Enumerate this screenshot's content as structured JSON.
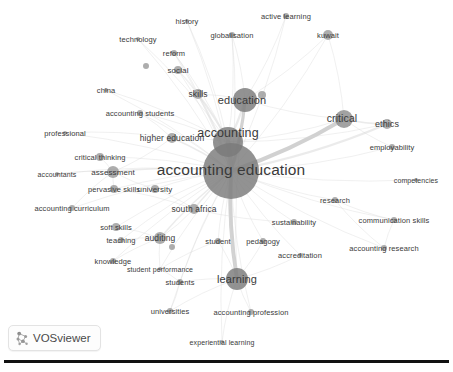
{
  "app": {
    "name": "VOSviewer",
    "badge_label": "VOSviewer",
    "logo_icon": "vosviewer-logo-icon",
    "background_color": "#ffffff"
  },
  "colors": {
    "node_fill": "#8d8d8d",
    "node_fill_dark": "#7a7a7a",
    "edge": "#d8d8d8",
    "edge_strong": "#c9c9c9",
    "label_text": "#3a3a3a",
    "rule": "#111111"
  },
  "chart_data": {
    "type": "scatter",
    "title": "",
    "subtitle": "",
    "xlabel": "",
    "ylabel": "",
    "grid": false,
    "legend_position": "none",
    "nodes": [
      {
        "label": "accounting education",
        "x": 231,
        "y": 171,
        "size": 28,
        "font_size": 15.5,
        "label_dx": 0,
        "label_dy": -1
      },
      {
        "label": "accounting",
        "x": 228,
        "y": 142,
        "size": 15,
        "font_size": 12.5,
        "label_dx": 0,
        "label_dy": -9
      },
      {
        "label": "education",
        "x": 245,
        "y": 100,
        "size": 12,
        "font_size": 11,
        "label_dx": -3,
        "label_dy": 0
      },
      {
        "label": "learning",
        "x": 237,
        "y": 279,
        "size": 11,
        "font_size": 11,
        "label_dx": 0,
        "label_dy": 0
      },
      {
        "label": "critical",
        "x": 344,
        "y": 119,
        "size": 9,
        "font_size": 10.5,
        "label_dx": -2,
        "label_dy": -1
      },
      {
        "label": "ethics",
        "x": 387,
        "y": 124,
        "size": 5,
        "font_size": 9,
        "label_dx": 0,
        "label_dy": 0
      },
      {
        "label": "higher education",
        "x": 172,
        "y": 138,
        "size": 5,
        "font_size": 8.5,
        "label_dx": 0,
        "label_dy": 0
      },
      {
        "label": "assessment",
        "x": 113,
        "y": 172,
        "size": 6,
        "font_size": 8,
        "label_dx": 0,
        "label_dy": 0
      },
      {
        "label": "skills",
        "x": 198,
        "y": 94,
        "size": 5,
        "font_size": 8.5,
        "label_dx": 0,
        "label_dy": 0
      },
      {
        "label": "auditing",
        "x": 160,
        "y": 238,
        "size": 6,
        "font_size": 8.5,
        "label_dx": 0,
        "label_dy": 0
      },
      {
        "label": "south africa",
        "x": 194,
        "y": 209,
        "size": 5,
        "font_size": 8.5,
        "label_dx": 0,
        "label_dy": 0
      },
      {
        "label": "university",
        "x": 155,
        "y": 189,
        "size": 4,
        "font_size": 8,
        "label_dx": 0,
        "label_dy": 0
      },
      {
        "label": "critical thinking",
        "x": 100,
        "y": 157,
        "size": 4,
        "font_size": 7.5,
        "label_dx": 0,
        "label_dy": 0
      },
      {
        "label": "pervasive skills",
        "x": 114,
        "y": 189,
        "size": 4,
        "font_size": 7.5,
        "label_dx": 0,
        "label_dy": 0
      },
      {
        "label": "soft skills",
        "x": 116,
        "y": 227,
        "size": 4,
        "font_size": 7.5,
        "label_dx": 0,
        "label_dy": 0
      },
      {
        "label": "teaching",
        "x": 121,
        "y": 240,
        "size": 3,
        "font_size": 7.5,
        "label_dx": 0,
        "label_dy": 0
      },
      {
        "label": "knowledge",
        "x": 113,
        "y": 261,
        "size": 3,
        "font_size": 7.5,
        "label_dx": 0,
        "label_dy": 0
      },
      {
        "label": "accounting curriculum",
        "x": 72,
        "y": 208,
        "size": 3,
        "font_size": 7.5,
        "label_dx": 0,
        "label_dy": 0
      },
      {
        "label": "accountants",
        "x": 57,
        "y": 174,
        "size": 2,
        "font_size": 7,
        "label_dx": 0,
        "label_dy": 0
      },
      {
        "label": "professional",
        "x": 65,
        "y": 133,
        "size": 2,
        "font_size": 7.5,
        "label_dx": 0,
        "label_dy": 0
      },
      {
        "label": "accounting students",
        "x": 140,
        "y": 113,
        "size": 3,
        "font_size": 7.5,
        "label_dx": 0,
        "label_dy": 0
      },
      {
        "label": "china",
        "x": 106,
        "y": 90,
        "size": 2,
        "font_size": 7.5,
        "label_dx": 0,
        "label_dy": 0
      },
      {
        "label": "technology",
        "x": 138,
        "y": 39,
        "size": 2,
        "font_size": 7.5,
        "label_dx": 0,
        "label_dy": 0
      },
      {
        "label": "reform",
        "x": 174,
        "y": 53,
        "size": 3,
        "font_size": 7.5,
        "label_dx": 0,
        "label_dy": 0
      },
      {
        "label": "social",
        "x": 178,
        "y": 70,
        "size": 4,
        "font_size": 8,
        "label_dx": 0,
        "label_dy": 0
      },
      {
        "label": "history",
        "x": 187,
        "y": 21,
        "size": 2,
        "font_size": 7.5,
        "label_dx": 0,
        "label_dy": 0
      },
      {
        "label": "globalisation",
        "x": 232,
        "y": 35,
        "size": 3,
        "font_size": 7.5,
        "label_dx": 0,
        "label_dy": 0
      },
      {
        "label": "active learning",
        "x": 286,
        "y": 16,
        "size": 3,
        "font_size": 7.5,
        "label_dx": 0,
        "label_dy": 0
      },
      {
        "label": "kuwait",
        "x": 328,
        "y": 35,
        "size": 5,
        "font_size": 7.5,
        "label_dx": 0,
        "label_dy": 0
      },
      {
        "label": "employability",
        "x": 392,
        "y": 147,
        "size": 3,
        "font_size": 7.5,
        "label_dx": 0,
        "label_dy": 0
      },
      {
        "label": "competencies",
        "x": 416,
        "y": 180,
        "size": 2,
        "font_size": 7,
        "label_dx": 0,
        "label_dy": 0
      },
      {
        "label": "research",
        "x": 335,
        "y": 200,
        "size": 3,
        "font_size": 7.5,
        "label_dx": 0,
        "label_dy": 0
      },
      {
        "label": "communication skills",
        "x": 394,
        "y": 220,
        "size": 3,
        "font_size": 7.5,
        "label_dx": 0,
        "label_dy": 0
      },
      {
        "label": "sustainability",
        "x": 294,
        "y": 222,
        "size": 3,
        "font_size": 7.5,
        "label_dx": 0,
        "label_dy": 0
      },
      {
        "label": "accounting research",
        "x": 384,
        "y": 248,
        "size": 3,
        "font_size": 7.5,
        "label_dx": 0,
        "label_dy": 0
      },
      {
        "label": "accreditation",
        "x": 300,
        "y": 255,
        "size": 2,
        "font_size": 7.5,
        "label_dx": 0,
        "label_dy": 0
      },
      {
        "label": "pedagogy",
        "x": 263,
        "y": 241,
        "size": 3,
        "font_size": 7.5,
        "label_dx": 0,
        "label_dy": 0
      },
      {
        "label": "student",
        "x": 218,
        "y": 241,
        "size": 3,
        "font_size": 7.5,
        "label_dx": 0,
        "label_dy": 0
      },
      {
        "label": "student performance",
        "x": 160,
        "y": 269,
        "size": 2,
        "font_size": 7,
        "label_dx": 0,
        "label_dy": 0
      },
      {
        "label": "students",
        "x": 180,
        "y": 282,
        "size": 3,
        "font_size": 7.5,
        "label_dx": 0,
        "label_dy": 0
      },
      {
        "label": "universities",
        "x": 170,
        "y": 311,
        "size": 3,
        "font_size": 7.5,
        "label_dx": 0,
        "label_dy": 0
      },
      {
        "label": "accounting profession",
        "x": 251,
        "y": 312,
        "size": 3,
        "font_size": 7.5,
        "label_dx": 0,
        "label_dy": 0
      },
      {
        "label": "experiential learning",
        "x": 222,
        "y": 342,
        "size": 2,
        "font_size": 7,
        "label_dx": 0,
        "label_dy": 0
      },
      {
        "label": "",
        "x": 146,
        "y": 66,
        "size": 3,
        "font_size": 0,
        "label_dx": 0,
        "label_dy": 0
      },
      {
        "label": "",
        "x": 262,
        "y": 95,
        "size": 4,
        "font_size": 0,
        "label_dx": 0,
        "label_dy": 0
      },
      {
        "label": "",
        "x": 172,
        "y": 247,
        "size": 3,
        "font_size": 0,
        "label_dx": 0,
        "label_dy": 0
      }
    ],
    "edges": [
      {
        "source": "accounting education",
        "target": "accounting",
        "weight": 6
      },
      {
        "source": "accounting education",
        "target": "education",
        "weight": 4
      },
      {
        "source": "accounting education",
        "target": "learning",
        "weight": 5
      },
      {
        "source": "accounting education",
        "target": "critical",
        "weight": 5
      },
      {
        "source": "accounting education",
        "target": "ethics",
        "weight": 3
      },
      {
        "source": "accounting education",
        "target": "higher education",
        "weight": 2
      },
      {
        "source": "accounting education",
        "target": "assessment",
        "weight": 2
      },
      {
        "source": "accounting education",
        "target": "skills",
        "weight": 2
      },
      {
        "source": "accounting education",
        "target": "auditing",
        "weight": 2
      },
      {
        "source": "accounting education",
        "target": "south africa",
        "weight": 2
      },
      {
        "source": "accounting education",
        "target": "university",
        "weight": 1
      },
      {
        "source": "accounting education",
        "target": "critical thinking",
        "weight": 1
      },
      {
        "source": "accounting education",
        "target": "pervasive skills",
        "weight": 1
      },
      {
        "source": "accounting education",
        "target": "soft skills",
        "weight": 1
      },
      {
        "source": "accounting education",
        "target": "teaching",
        "weight": 1
      },
      {
        "source": "accounting education",
        "target": "knowledge",
        "weight": 1
      },
      {
        "source": "accounting education",
        "target": "accounting curriculum",
        "weight": 1
      },
      {
        "source": "accounting education",
        "target": "accountants",
        "weight": 1
      },
      {
        "source": "accounting education",
        "target": "professional",
        "weight": 1
      },
      {
        "source": "accounting education",
        "target": "accounting students",
        "weight": 1
      },
      {
        "source": "accounting education",
        "target": "china",
        "weight": 1
      },
      {
        "source": "accounting education",
        "target": "technology",
        "weight": 1
      },
      {
        "source": "accounting education",
        "target": "reform",
        "weight": 1
      },
      {
        "source": "accounting education",
        "target": "social",
        "weight": 1
      },
      {
        "source": "accounting education",
        "target": "history",
        "weight": 1
      },
      {
        "source": "accounting education",
        "target": "globalisation",
        "weight": 1
      },
      {
        "source": "accounting education",
        "target": "active learning",
        "weight": 1
      },
      {
        "source": "accounting education",
        "target": "kuwait",
        "weight": 1
      },
      {
        "source": "accounting education",
        "target": "employability",
        "weight": 1
      },
      {
        "source": "accounting education",
        "target": "competencies",
        "weight": 1
      },
      {
        "source": "accounting education",
        "target": "research",
        "weight": 1
      },
      {
        "source": "accounting education",
        "target": "communication skills",
        "weight": 1
      },
      {
        "source": "accounting education",
        "target": "sustainability",
        "weight": 1
      },
      {
        "source": "accounting education",
        "target": "accounting research",
        "weight": 1
      },
      {
        "source": "accounting education",
        "target": "accreditation",
        "weight": 1
      },
      {
        "source": "accounting education",
        "target": "pedagogy",
        "weight": 1
      },
      {
        "source": "accounting education",
        "target": "student",
        "weight": 1
      },
      {
        "source": "accounting education",
        "target": "student performance",
        "weight": 1
      },
      {
        "source": "accounting education",
        "target": "students",
        "weight": 1
      },
      {
        "source": "accounting education",
        "target": "universities",
        "weight": 1
      },
      {
        "source": "accounting education",
        "target": "accounting profession",
        "weight": 1
      },
      {
        "source": "accounting education",
        "target": "experiential learning",
        "weight": 1
      },
      {
        "source": "accounting",
        "target": "education",
        "weight": 3
      },
      {
        "source": "accounting",
        "target": "skills",
        "weight": 2
      },
      {
        "source": "accounting",
        "target": "higher education",
        "weight": 1
      },
      {
        "source": "accounting",
        "target": "accounting students",
        "weight": 1
      },
      {
        "source": "accounting",
        "target": "social",
        "weight": 1
      },
      {
        "source": "accounting",
        "target": "reform",
        "weight": 1
      },
      {
        "source": "accounting",
        "target": "history",
        "weight": 1
      },
      {
        "source": "accounting",
        "target": "globalisation",
        "weight": 1
      },
      {
        "source": "accounting",
        "target": "critical",
        "weight": 1
      },
      {
        "source": "accounting",
        "target": "learning",
        "weight": 1
      },
      {
        "source": "accounting",
        "target": "china",
        "weight": 1
      },
      {
        "source": "accounting",
        "target": "technology",
        "weight": 1
      },
      {
        "source": "accounting",
        "target": "ethics",
        "weight": 1
      },
      {
        "source": "education",
        "target": "active learning",
        "weight": 1
      },
      {
        "source": "education",
        "target": "kuwait",
        "weight": 1
      },
      {
        "source": "education",
        "target": "globalisation",
        "weight": 1
      },
      {
        "source": "education",
        "target": "critical",
        "weight": 1
      },
      {
        "source": "education",
        "target": "skills",
        "weight": 1
      },
      {
        "source": "education",
        "target": "learning",
        "weight": 1
      },
      {
        "source": "critical",
        "target": "ethics",
        "weight": 2
      },
      {
        "source": "critical",
        "target": "employability",
        "weight": 1
      },
      {
        "source": "critical",
        "target": "kuwait",
        "weight": 1
      },
      {
        "source": "learning",
        "target": "students",
        "weight": 1
      },
      {
        "source": "learning",
        "target": "universities",
        "weight": 1
      },
      {
        "source": "learning",
        "target": "accounting profession",
        "weight": 1
      },
      {
        "source": "learning",
        "target": "experiential learning",
        "weight": 1
      },
      {
        "source": "learning",
        "target": "pedagogy",
        "weight": 1
      },
      {
        "source": "learning",
        "target": "student",
        "weight": 1
      },
      {
        "source": "learning",
        "target": "accreditation",
        "weight": 1
      },
      {
        "source": "assessment",
        "target": "higher education",
        "weight": 1
      },
      {
        "source": "assessment",
        "target": "critical thinking",
        "weight": 1
      },
      {
        "source": "assessment",
        "target": "pervasive skills",
        "weight": 1
      },
      {
        "source": "assessment",
        "target": "accountants",
        "weight": 1
      },
      {
        "source": "assessment",
        "target": "university",
        "weight": 1
      },
      {
        "source": "assessment",
        "target": "accounting curriculum",
        "weight": 1
      },
      {
        "source": "auditing",
        "target": "soft skills",
        "weight": 1
      },
      {
        "source": "auditing",
        "target": "teaching",
        "weight": 1
      },
      {
        "source": "auditing",
        "target": "knowledge",
        "weight": 1
      },
      {
        "source": "auditing",
        "target": "south africa",
        "weight": 1
      },
      {
        "source": "auditing",
        "target": "student performance",
        "weight": 1
      },
      {
        "source": "south africa",
        "target": "pervasive skills",
        "weight": 1
      },
      {
        "source": "south africa",
        "target": "university",
        "weight": 1
      },
      {
        "source": "south africa",
        "target": "sustainability",
        "weight": 1
      },
      {
        "source": "research",
        "target": "accounting research",
        "weight": 1
      },
      {
        "source": "research",
        "target": "communication skills",
        "weight": 1
      },
      {
        "source": "communication skills",
        "target": "accounting research",
        "weight": 1
      },
      {
        "source": "skills",
        "target": "social",
        "weight": 1
      },
      {
        "source": "skills",
        "target": "reform",
        "weight": 1
      },
      {
        "source": "higher education",
        "target": "professional",
        "weight": 1
      },
      {
        "source": "higher education",
        "target": "accounting students",
        "weight": 1
      },
      {
        "source": "student",
        "target": "student performance",
        "weight": 1
      },
      {
        "source": "students",
        "target": "student performance",
        "weight": 1
      },
      {
        "source": "universities",
        "target": "students",
        "weight": 1
      }
    ]
  }
}
